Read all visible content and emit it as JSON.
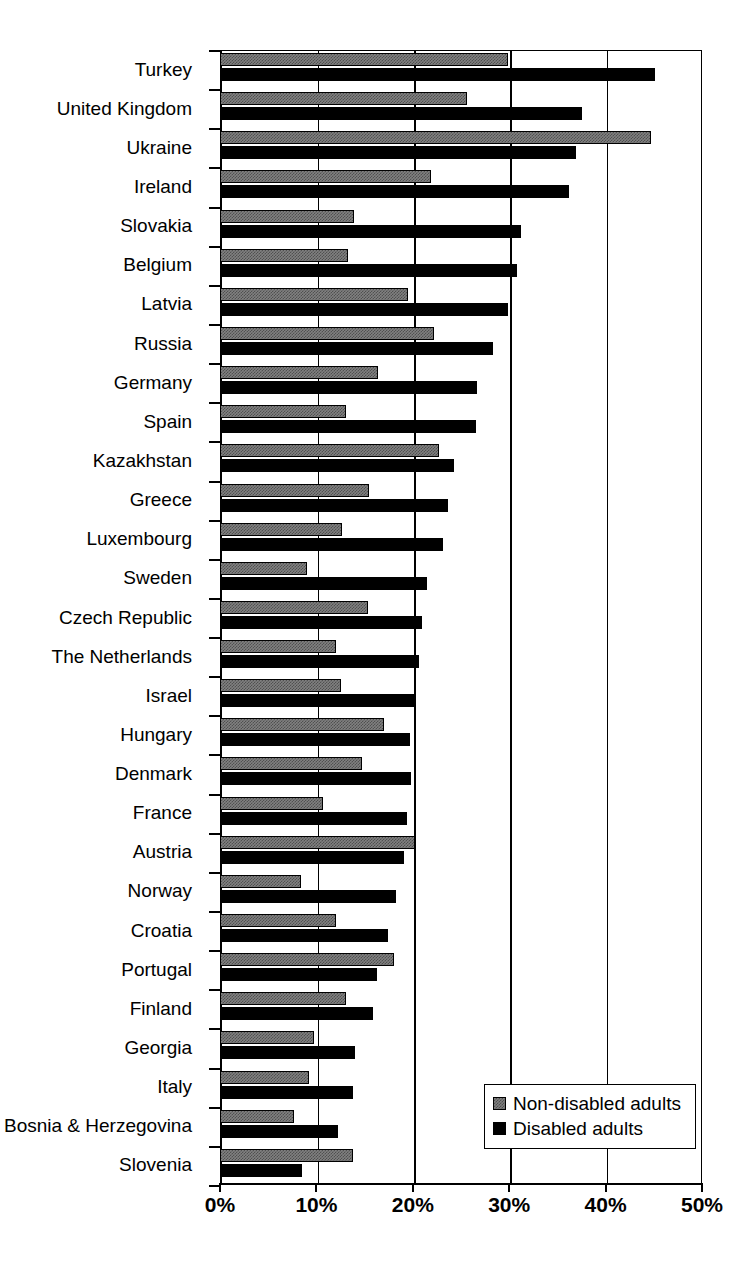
{
  "chart_data": {
    "type": "bar",
    "orientation": "horizontal",
    "title": "",
    "subtitle": "",
    "xlabel": "",
    "ylabel": "",
    "xlim": [
      0,
      50
    ],
    "xunit": "%",
    "xticks": [
      0,
      10,
      20,
      30,
      40,
      50
    ],
    "xtick_labels": [
      "0%",
      "10%",
      "20%",
      "30%",
      "40%",
      "50%"
    ],
    "grid": "vertical-only",
    "legend_position": "bottom-right",
    "categories": [
      "Turkey",
      "United Kingdom",
      "Ukraine",
      "Ireland",
      "Slovakia",
      "Belgium",
      "Latvia",
      "Russia",
      "Germany",
      "Spain",
      "Kazakhstan",
      "Greece",
      "Luxembourg",
      "Sweden",
      "Czech Republic",
      "The Netherlands",
      "Israel",
      "Hungary",
      "Denmark",
      "France",
      "Austria",
      "Norway",
      "Croatia",
      "Portugal",
      "Finland",
      "Georgia",
      "Italy",
      "Bosnia & Herzegovina",
      "Slovenia"
    ],
    "series": [
      {
        "name": "Non-disabled adults",
        "color": "#808080",
        "pattern": "checker-dither",
        "values": [
          29.9,
          25.6,
          44.7,
          21.9,
          13.9,
          13.3,
          19.5,
          22.2,
          16.4,
          13.1,
          22.7,
          15.5,
          12.7,
          9.0,
          15.4,
          12.0,
          12.6,
          17.0,
          14.7,
          10.7,
          20.2,
          8.4,
          12.0,
          18.1,
          13.1,
          9.8,
          9.2,
          7.7,
          13.8
        ]
      },
      {
        "name": "Disabled adults",
        "color": "#000000",
        "pattern": "solid",
        "values": [
          45.1,
          37.5,
          36.9,
          36.2,
          31.2,
          30.8,
          29.9,
          28.3,
          26.7,
          26.6,
          24.3,
          23.6,
          23.1,
          21.5,
          21.0,
          20.6,
          20.3,
          19.7,
          19.8,
          19.4,
          19.1,
          18.3,
          17.4,
          16.3,
          15.9,
          14.0,
          13.8,
          12.2,
          8.5
        ]
      }
    ]
  },
  "legend": {
    "items": [
      {
        "label": "Non-disabled adults"
      },
      {
        "label": "Disabled adults"
      }
    ]
  }
}
